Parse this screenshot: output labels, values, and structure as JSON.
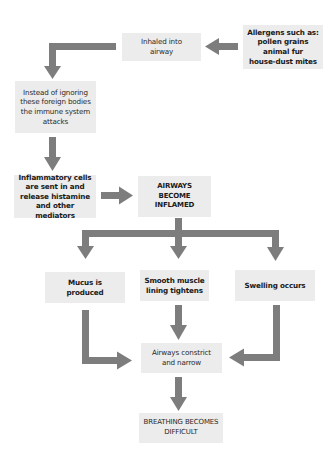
{
  "diagram": {
    "title": "",
    "colors": {
      "box_fill": "#ececec",
      "arrow": "#7d7d7d",
      "text": "#2a2a2a"
    },
    "nodes": {
      "allergens": "Allergens such as:\npollen grains\nanimal fur\nhouse-dust mites",
      "inhaled": "Inhaled into\nairway",
      "immune": "Instead of ignoring\nthese foreign bodies\nthe immune system\nattacks",
      "inflammatory": "Inflammatory cells\nare sent in and\nrelease histamine\nand other mediators",
      "inflamed": "AIRWAYS\nBECOME\nINFLAMED",
      "mucus": "Mucus is\nproduced",
      "smooth_muscle": "Smooth muscle\nlining tightens",
      "swelling": "Swelling occurs",
      "constrict": "Airways constrict\nand narrow",
      "breathing": "BREATHING BECOMES\nDIFFICULT"
    },
    "edges": [
      {
        "from": "allergens",
        "to": "inhaled"
      },
      {
        "from": "inhaled",
        "to": "immune"
      },
      {
        "from": "immune",
        "to": "inflammatory"
      },
      {
        "from": "inflammatory",
        "to": "inflamed"
      },
      {
        "from": "inflamed",
        "to": "mucus"
      },
      {
        "from": "inflamed",
        "to": "smooth_muscle"
      },
      {
        "from": "inflamed",
        "to": "swelling"
      },
      {
        "from": "mucus",
        "to": "constrict"
      },
      {
        "from": "smooth_muscle",
        "to": "constrict"
      },
      {
        "from": "swelling",
        "to": "constrict"
      },
      {
        "from": "constrict",
        "to": "breathing"
      }
    ]
  }
}
